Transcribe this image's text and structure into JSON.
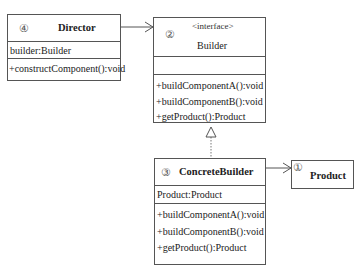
{
  "diagram": {
    "type": "UML class diagram (Builder pattern)",
    "classes": {
      "director": {
        "number": "④",
        "name": "Director",
        "attributes": [
          "builder:Builder"
        ],
        "methods": [
          "+constructComponent():void"
        ]
      },
      "builder": {
        "number": "②",
        "stereotype": "<interface>",
        "name": "Builder",
        "attributes": [],
        "methods": [
          "+buildComponentA():void",
          "+buildComponentB():void",
          "+getProduct():Product"
        ]
      },
      "concrete_builder": {
        "number": "③",
        "name": "ConcreteBuilder",
        "attributes": [
          "Product:Product"
        ],
        "methods": [
          "+buildComponentA():void",
          "+buildComponentB():void",
          "+getProduct():Product"
        ]
      },
      "product": {
        "number": "①",
        "name": "Product"
      }
    },
    "relations": [
      {
        "from": "Director",
        "to": "Builder",
        "kind": "association",
        "arrow": "open"
      },
      {
        "from": "ConcreteBuilder",
        "to": "Builder",
        "kind": "realization",
        "arrow": "hollow-triangle",
        "line": "dotted"
      },
      {
        "from": "ConcreteBuilder",
        "to": "Product",
        "kind": "association",
        "arrow": "open"
      }
    ],
    "colors": {
      "line": "#555555",
      "text": "#222222",
      "background": "#ffffff"
    }
  }
}
